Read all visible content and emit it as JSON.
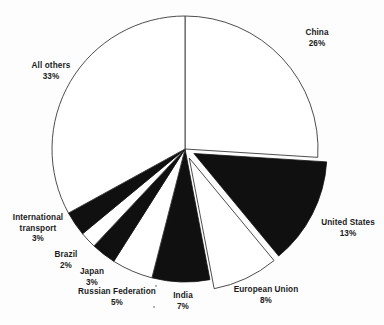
{
  "chart_data": {
    "type": "pie",
    "title": "",
    "subtitle": "",
    "xlabel": "",
    "ylabel": "",
    "legend_position": "none",
    "grid": false,
    "units": "percent",
    "start_angle_deg": 0,
    "direction": "clockwise",
    "categories": [
      "China",
      "United States",
      "European Union",
      "India",
      "Russian Federation",
      "Japan",
      "Brazil",
      "International transport",
      "All others"
    ],
    "values": [
      26,
      13,
      8,
      7,
      5,
      3,
      2,
      3,
      33
    ],
    "slices": [
      {
        "name": "China",
        "value": 26,
        "label": "China",
        "pct_label": "26%",
        "fill": "white",
        "exploded": false
      },
      {
        "name": "United States",
        "value": 13,
        "label": "United States",
        "pct_label": "13%",
        "fill": "black",
        "exploded": true
      },
      {
        "name": "European Union",
        "value": 8,
        "label": "European Union",
        "pct_label": "8%",
        "fill": "white",
        "exploded": true
      },
      {
        "name": "India",
        "value": 7,
        "label": "India",
        "pct_label": "7%",
        "fill": "black",
        "exploded": false
      },
      {
        "name": "Russian Federation",
        "value": 5,
        "label": "Russian Federation",
        "pct_label": "5%",
        "fill": "white",
        "exploded": false
      },
      {
        "name": "Japan",
        "value": 3,
        "label": "Japan",
        "pct_label": "3%",
        "fill": "black",
        "exploded": false
      },
      {
        "name": "Brazil",
        "value": 2,
        "label": "Brazil",
        "pct_label": "2%",
        "fill": "white",
        "exploded": false
      },
      {
        "name": "International transport",
        "value": 3,
        "label": "International transport",
        "pct_label": "3%",
        "fill": "black",
        "exploded": false
      },
      {
        "name": "All others",
        "value": 33,
        "label": "All others",
        "pct_label": "33%",
        "fill": "white",
        "exploded": false
      }
    ],
    "colors": {
      "dark_slice": "#101010",
      "light_slice": "#ffffff",
      "slice_outline": "#3a3a3a",
      "label_text": "#1b1b1b",
      "background": "#fdfdfd"
    }
  },
  "labels": {
    "china": {
      "name": "China",
      "pct": "26%"
    },
    "united_states": {
      "name": "United States",
      "pct": "13%"
    },
    "european_union": {
      "name": "European Union",
      "pct": "8%"
    },
    "india": {
      "name": "India",
      "pct": "7%"
    },
    "russian_federation": {
      "name": "Russian Federation",
      "pct": "5%"
    },
    "japan": {
      "name": "Japan",
      "pct": "3%"
    },
    "brazil": {
      "name": "Brazil",
      "pct": "2%"
    },
    "international_transport_line1": "International",
    "international_transport_line2": "transport",
    "international_transport_pct": "3%",
    "all_others": {
      "name": "All others",
      "pct": "33%"
    }
  }
}
